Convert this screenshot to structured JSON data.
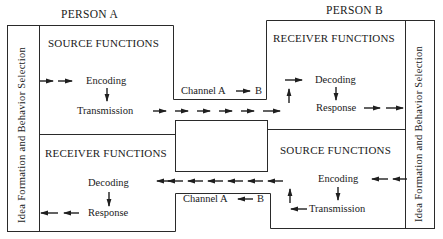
{
  "person_a": {
    "title": "PERSON A",
    "side_bar": "Idea Formation and Behavior Selection",
    "source_functions": {
      "heading": "SOURCE FUNCTIONS",
      "step1": "Encoding",
      "step2": "Transmission"
    },
    "receiver_functions": {
      "heading": "RECEIVER FUNCTIONS",
      "step1": "Decoding",
      "step2": "Response"
    }
  },
  "person_b": {
    "title": "PERSON B",
    "side_bar": "Idea Formation and Behavior Selection",
    "receiver_functions": {
      "heading": "RECEIVER FUNCTIONS",
      "step1": "Decoding",
      "step2": "Response"
    },
    "source_functions": {
      "heading": "SOURCE FUNCTIONS",
      "step1": "Encoding",
      "step2": "Transmission"
    }
  },
  "channels": {
    "a_to_b": {
      "label": "Channel A",
      "from": "A",
      "to": "B",
      "suffix": "B"
    },
    "b_to_a": {
      "label": "Channel A",
      "from": "B",
      "to": "A",
      "suffix": "B"
    }
  },
  "colors": {
    "line": "#2a2a2a",
    "text": "#1a1a1a",
    "background": "#ffffff"
  }
}
